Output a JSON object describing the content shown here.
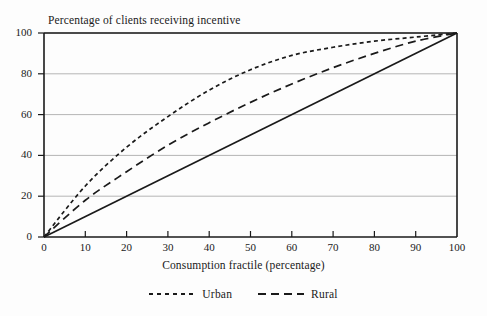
{
  "chart_data": {
    "type": "line",
    "title": "Percentage of clients receiving incentive",
    "xlabel": "Consumption fractile (percentage)",
    "ylabel": "",
    "xlim": [
      0,
      100
    ],
    "ylim": [
      0,
      100
    ],
    "grid": "horizontal",
    "legend_position": "bottom",
    "xticks": [
      "0",
      "10",
      "20",
      "30",
      "40",
      "50",
      "60",
      "70",
      "80",
      "90",
      "100"
    ],
    "yticks": [
      "0",
      "20",
      "40",
      "60",
      "80",
      "100"
    ],
    "x": [
      0,
      10,
      20,
      30,
      40,
      50,
      60,
      70,
      80,
      90,
      100
    ],
    "series": [
      {
        "name": "Urban",
        "style": "short-dash",
        "color": "#1a1a1a",
        "values": [
          0,
          25,
          44,
          59,
          72,
          82,
          89,
          93,
          96,
          98,
          100
        ]
      },
      {
        "name": "Rural",
        "style": "long-dash",
        "color": "#1a1a1a",
        "values": [
          0,
          18,
          32,
          45,
          56,
          66,
          75,
          83,
          90,
          96,
          100
        ]
      },
      {
        "name": "Line of equality",
        "style": "solid",
        "color": "#1a1a1a",
        "values": [
          0,
          10,
          20,
          30,
          40,
          50,
          60,
          70,
          80,
          90,
          100
        ]
      }
    ],
    "legend": [
      {
        "label": "Urban",
        "style": "short-dash"
      },
      {
        "label": "Rural",
        "style": "long-dash"
      }
    ]
  }
}
